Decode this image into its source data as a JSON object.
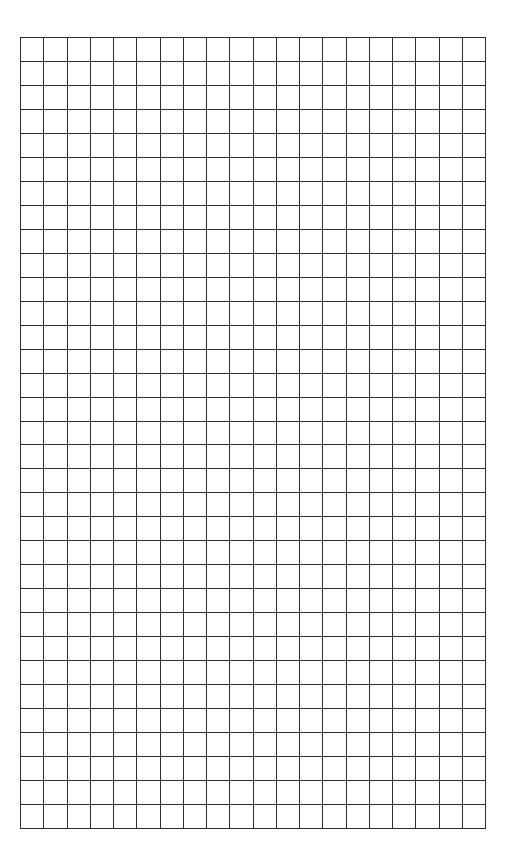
{
  "page": {
    "background": "#ffffff"
  },
  "grid": {
    "columns": 20,
    "rows": 33,
    "line_color": "#2e2e2e",
    "cell_width_px": 23.3,
    "cell_height_px": 24
  }
}
